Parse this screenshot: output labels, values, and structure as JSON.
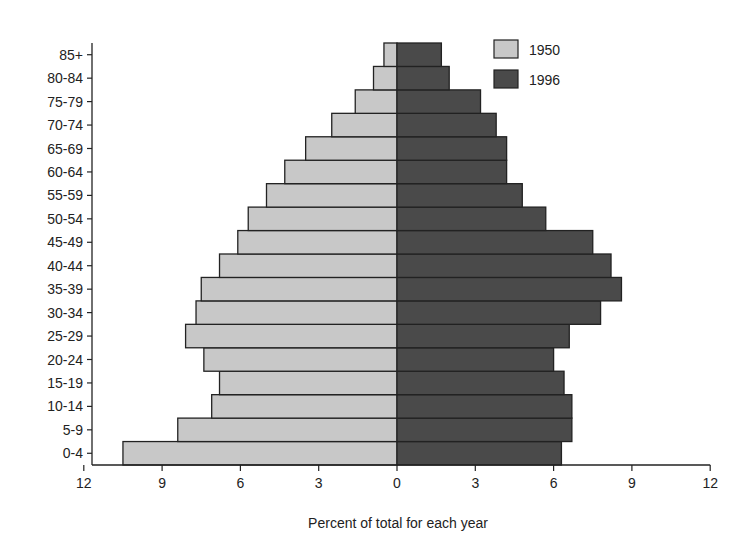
{
  "chart_data": {
    "type": "bar",
    "orientation": "horizontal",
    "subtype": "population-pyramid",
    "title": "",
    "xlabel": "Percent of total for each year",
    "ylabel": "",
    "categories": [
      "0-4",
      "5-9",
      "10-14",
      "15-19",
      "20-24",
      "25-29",
      "30-34",
      "35-39",
      "40-44",
      "45-49",
      "50-54",
      "55-59",
      "60-64",
      "65-69",
      "70-74",
      "75-79",
      "80-84",
      "85+"
    ],
    "series": [
      {
        "name": "1950",
        "side": "left",
        "color": "#c8c8c8",
        "values": [
          10.5,
          8.4,
          7.1,
          6.8,
          7.4,
          8.1,
          7.7,
          7.5,
          6.8,
          6.1,
          5.7,
          5.0,
          4.3,
          3.5,
          2.5,
          1.6,
          0.9,
          0.5
        ]
      },
      {
        "name": "1996",
        "side": "right",
        "color": "#4a4a4a",
        "values": [
          6.3,
          6.7,
          6.7,
          6.4,
          6.0,
          6.6,
          7.8,
          8.6,
          8.2,
          7.5,
          5.7,
          4.8,
          4.2,
          4.2,
          3.8,
          3.2,
          2.0,
          1.7
        ]
      }
    ],
    "xticks_left": [
      "12",
      "9",
      "6",
      "3",
      "0"
    ],
    "xticks_right": [
      "3",
      "6",
      "9",
      "12"
    ],
    "xlim": [
      -12,
      12
    ],
    "grid": false,
    "legend_position": "top-right"
  },
  "legend": {
    "items": [
      {
        "label": "1950"
      },
      {
        "label": "1996"
      }
    ]
  },
  "axis": {
    "xlabel": "Percent of total for each year"
  }
}
